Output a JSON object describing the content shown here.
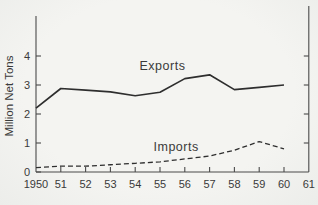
{
  "figure": {
    "background": "#f2f2ef",
    "ink": "#2e2e2e",
    "axis_color": "#4a4a4a",
    "text_color": "#3a3a3a"
  },
  "chart_data": {
    "type": "line",
    "title": "",
    "xlabel": "",
    "ylabel": "Million Net Tons",
    "x": [
      1950,
      1951,
      1952,
      1953,
      1954,
      1955,
      1956,
      1957,
      1958,
      1959,
      1960
    ],
    "x_tick_labels": [
      "1950",
      "51",
      "52",
      "53",
      "54",
      "55",
      "56",
      "57",
      "58",
      "59",
      "60",
      "61"
    ],
    "y_ticks": [
      0,
      1,
      2,
      3,
      4
    ],
    "ylim": [
      0,
      5.4
    ],
    "grid": false,
    "legend_position": "inline-labels",
    "series": [
      {
        "name": "Exports",
        "style": "solid",
        "values": [
          2.2,
          2.88,
          2.82,
          2.76,
          2.63,
          2.75,
          3.22,
          3.35,
          2.84,
          2.92,
          3.0
        ]
      },
      {
        "name": "Imports",
        "style": "dashed",
        "values": [
          0.15,
          0.2,
          0.2,
          0.25,
          0.3,
          0.35,
          0.45,
          0.55,
          0.75,
          1.05,
          0.8
        ]
      }
    ],
    "annotations": [
      {
        "text": "Exports",
        "year": 1955.1,
        "value": 3.66
      },
      {
        "text": "Imports",
        "year": 1955.65,
        "value": 0.86
      }
    ]
  }
}
